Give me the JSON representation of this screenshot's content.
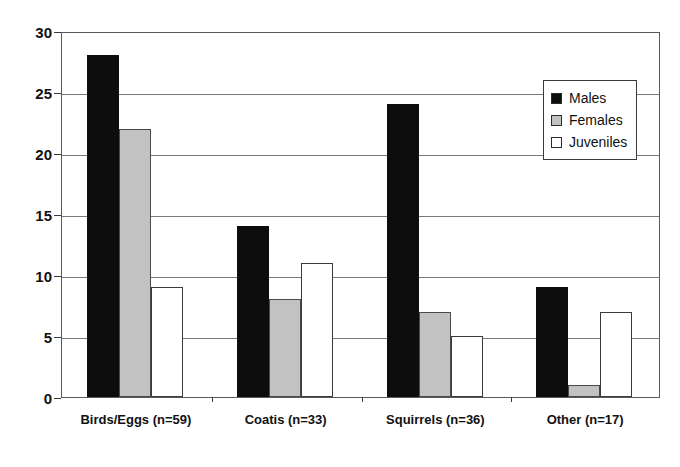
{
  "chart_data": {
    "type": "bar",
    "title": "",
    "subtitle": "",
    "xlabel": "",
    "ylabel": "",
    "ylim": [
      0,
      30
    ],
    "yticks": [
      0,
      5,
      10,
      15,
      20,
      25,
      30
    ],
    "ytick_labels": [
      "0",
      "5",
      "10",
      "15",
      "20",
      "25",
      "30"
    ],
    "grid": true,
    "grid_axis": "y",
    "legend_position": "top-right",
    "categories": [
      "Birds/Eggs (n=59)",
      "Coatis (n=33)",
      "Squirrels (n=36)",
      "Other (n=17)"
    ],
    "series": [
      {
        "name": "Males",
        "color": "#0d0d0d",
        "values": [
          28,
          14,
          24,
          9
        ]
      },
      {
        "name": "Females",
        "color": "#c2c2c2",
        "values": [
          22,
          8,
          7,
          1
        ]
      },
      {
        "name": "Juveniles",
        "color": "#ffffff",
        "values": [
          9,
          11,
          5,
          7
        ]
      }
    ]
  },
  "legend": {
    "entries": [
      {
        "label": "Males"
      },
      {
        "label": "Females"
      },
      {
        "label": "Juveniles"
      }
    ]
  }
}
